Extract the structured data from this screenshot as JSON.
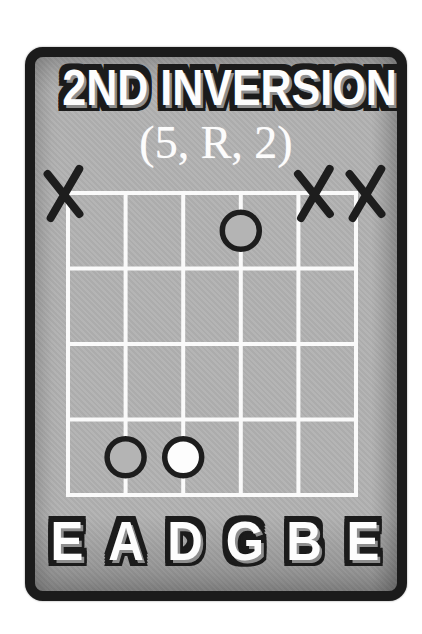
{
  "header": {
    "title": "2ND INVERSION",
    "interval_formula": "(5, R, 2)"
  },
  "diagram": {
    "type": "guitar-chord-grid",
    "num_strings": 6,
    "num_frets": 4,
    "string_names": [
      "E",
      "A",
      "D",
      "G",
      "B",
      "E"
    ],
    "muted_strings": [
      1,
      5,
      6
    ],
    "markers": [
      {
        "string": 4,
        "fret": 1,
        "fill": "gray"
      },
      {
        "string": 2,
        "fret": 4,
        "fill": "gray"
      },
      {
        "string": 3,
        "fret": 4,
        "fill": "white"
      }
    ],
    "colors": {
      "card_background": "#b2b2b2",
      "ink": "#1d1d1d",
      "grid_line": "#fafafa",
      "marker_white": "#fdfdfd",
      "marker_gray": "#b4b4b4"
    }
  }
}
